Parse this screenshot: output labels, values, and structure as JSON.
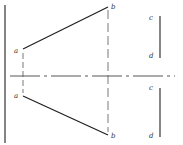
{
  "diagram": {
    "type": "orthographic-projection",
    "colors": {
      "line": "#222222",
      "projector": "#555555",
      "label": "#333333",
      "background": "#ffffff"
    },
    "labels": {
      "top_a": "a",
      "top_b": "b",
      "top_c": "c",
      "top_d": "d",
      "bottom_a": "a",
      "bottom_b": "b",
      "bottom_c": "c",
      "bottom_d": "d"
    },
    "lines": {
      "profile_line": {
        "x1": 5,
        "y1": 5,
        "x2": 5,
        "y2": 143
      },
      "xy_axis": {
        "x1": 10,
        "y1": 76,
        "x2": 175,
        "y2": 76,
        "style": "dash-dot"
      },
      "top_ab": {
        "x1": 23,
        "y1": 49,
        "x2": 108,
        "y2": 7
      },
      "bottom_ab": {
        "x1": 23,
        "y1": 96,
        "x2": 108,
        "y2": 135
      },
      "projector_b": {
        "x1": 108,
        "y1": 10,
        "x2": 108,
        "y2": 132,
        "style": "dashed"
      },
      "projector_a": {
        "x1": 23,
        "y1": 53,
        "x2": 23,
        "y2": 93,
        "style": "dashed"
      },
      "top_cd": {
        "x1": 160,
        "y1": 16,
        "x2": 160,
        "y2": 58
      },
      "bottom_cd": {
        "x1": 160,
        "y1": 88,
        "x2": 160,
        "y2": 137
      }
    }
  }
}
